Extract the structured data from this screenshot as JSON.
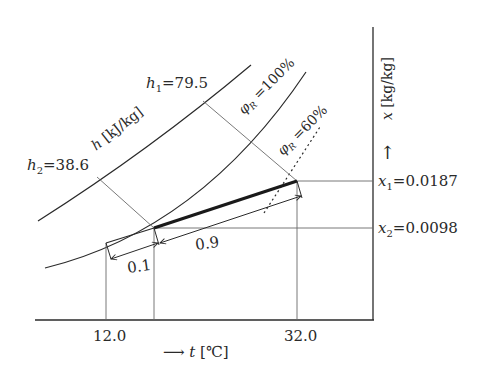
{
  "diagram": {
    "type": "psychrometric mixing diagram (Mollier h-x style)",
    "x_axis": {
      "label_arrow": "⟶",
      "label_var": "t",
      "label_unit": "[℃]",
      "ticks": [
        {
          "value": "12.0"
        },
        {
          "value": "32.0"
        }
      ]
    },
    "y_axis": {
      "label_var": "x",
      "label_unit": "[kg/kg]",
      "arrow": "↑",
      "ticks": [
        {
          "var": "x",
          "sub": "1",
          "eq": "=0.0187"
        },
        {
          "var": "x",
          "sub": "2",
          "eq": "=0.0098"
        }
      ]
    },
    "enthalpy": {
      "axis_label_var": "h",
      "axis_label_unit": "[kJ/kg]",
      "h1": {
        "var": "h",
        "sub": "1",
        "eq": "=79.5"
      },
      "h2": {
        "var": "h",
        "sub": "2",
        "eq": "=38.6"
      }
    },
    "curves": {
      "saturation": {
        "var": "φ",
        "sub": "R",
        "eq": "=100%"
      },
      "rh60": {
        "var": "φ",
        "sub": "R",
        "eq": "=60%"
      }
    },
    "mixing": {
      "ratio_small": "0.1",
      "ratio_large": "0.9"
    },
    "colors": {
      "line": "#2a2a2a",
      "thin_line": "#6a6a6a",
      "background": "#ffffff"
    }
  }
}
